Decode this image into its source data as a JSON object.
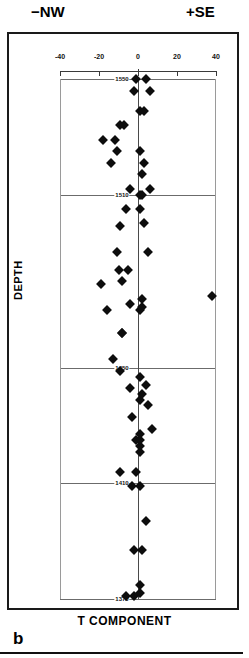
{
  "headers": {
    "left_direction": "−NW",
    "right_direction": "+SE"
  },
  "panel": {
    "label": "b"
  },
  "axis_titles": {
    "x": "T COMPONENT",
    "y": "DEPTH"
  },
  "chart_data": {
    "type": "scatter",
    "title": "",
    "xlabel": "T COMPONENT",
    "ylabel": "DEPTH",
    "xlim": [
      -40,
      40
    ],
    "ylim": [
      1550,
      1370
    ],
    "xticks": [
      -40,
      -20,
      0,
      20,
      40
    ],
    "xticklabels": [
      "-40",
      "-20",
      "0",
      "20",
      "40"
    ],
    "yticks": [
      1370,
      1410,
      1450,
      1510,
      1550
    ],
    "yticklabels": [
      "1370",
      "1410",
      "1450",
      "1510",
      "1550"
    ],
    "grid": "horizontal-depth-lines",
    "legend": "none",
    "marker": "filled-diamond",
    "marker_color": "#0d0d0d",
    "zero_reference_line": 0,
    "direction_left": "−NW",
    "direction_right": "+SE",
    "points": [
      {
        "x": -6,
        "y": 1371
      },
      {
        "x": -2,
        "y": 1371
      },
      {
        "x": 1,
        "y": 1372
      },
      {
        "x": 1,
        "y": 1375
      },
      {
        "x": 2,
        "y": 1387
      },
      {
        "x": -2,
        "y": 1387
      },
      {
        "x": 4,
        "y": 1397
      },
      {
        "x": 1,
        "y": 1409
      },
      {
        "x": -3,
        "y": 1409
      },
      {
        "x": -9,
        "y": 1414
      },
      {
        "x": -1,
        "y": 1414
      },
      {
        "x": 1,
        "y": 1421
      },
      {
        "x": 1,
        "y": 1423
      },
      {
        "x": -1,
        "y": 1425
      },
      {
        "x": 1,
        "y": 1425
      },
      {
        "x": 1,
        "y": 1427
      },
      {
        "x": 7,
        "y": 1429
      },
      {
        "x": 5,
        "y": 1437
      },
      {
        "x": -3,
        "y": 1433
      },
      {
        "x": 1,
        "y": 1439
      },
      {
        "x": 2,
        "y": 1441
      },
      {
        "x": -4,
        "y": 1443
      },
      {
        "x": 4,
        "y": 1444
      },
      {
        "x": -9,
        "y": 1449
      },
      {
        "x": 1,
        "y": 1447
      },
      {
        "x": -13,
        "y": 1453
      },
      {
        "x": -8,
        "y": 1462
      },
      {
        "x": -8,
        "y": 1462
      },
      {
        "x": -16,
        "y": 1470
      },
      {
        "x": 1,
        "y": 1470
      },
      {
        "x": 2,
        "y": 1471
      },
      {
        "x": -4,
        "y": 1472
      },
      {
        "x": 2,
        "y": 1474
      },
      {
        "x": 38,
        "y": 1475
      },
      {
        "x": -19,
        "y": 1479
      },
      {
        "x": -8,
        "y": 1480
      },
      {
        "x": -10,
        "y": 1484
      },
      {
        "x": -5,
        "y": 1484
      },
      {
        "x": -11,
        "y": 1490
      },
      {
        "x": 5,
        "y": 1490
      },
      {
        "x": -9,
        "y": 1499
      },
      {
        "x": 3,
        "y": 1500
      },
      {
        "x": -6,
        "y": 1505
      },
      {
        "x": 1,
        "y": 1505
      },
      {
        "x": -4,
        "y": 1512
      },
      {
        "x": 6,
        "y": 1512
      },
      {
        "x": 1,
        "y": 1510
      },
      {
        "x": 2,
        "y": 1510
      },
      {
        "x": 2,
        "y": 1517
      },
      {
        "x": 3,
        "y": 1521
      },
      {
        "x": -14,
        "y": 1521
      },
      {
        "x": 1,
        "y": 1525
      },
      {
        "x": -11,
        "y": 1525
      },
      {
        "x": -18,
        "y": 1529
      },
      {
        "x": -12,
        "y": 1529
      },
      {
        "x": -9,
        "y": 1534
      },
      {
        "x": -7,
        "y": 1534
      },
      {
        "x": 1,
        "y": 1539
      },
      {
        "x": 3,
        "y": 1539
      },
      {
        "x": -2,
        "y": 1546
      },
      {
        "x": 6,
        "y": 1546
      },
      {
        "x": -1,
        "y": 1550
      },
      {
        "x": 4,
        "y": 1550
      }
    ]
  }
}
